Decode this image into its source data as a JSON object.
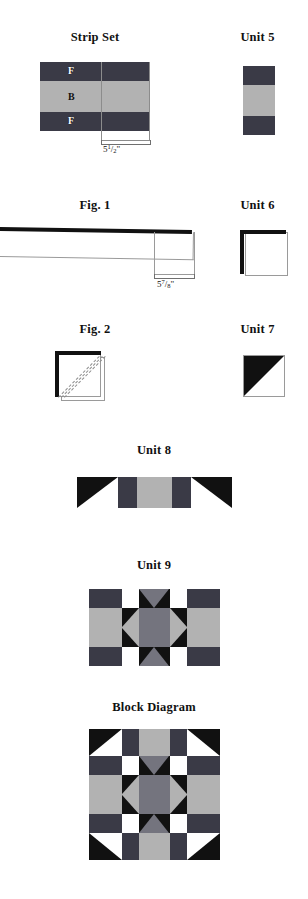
{
  "document": {
    "type": "quilt-block-instruction-diagrams"
  },
  "palette": {
    "dark": "#3a3a46",
    "black": "#111111",
    "medium_gray": "#74747e",
    "light_gray": "#b2b2b2",
    "white": "#ffffff",
    "outline": "#9a9a9a",
    "guide": "#8c8c8c"
  },
  "figures": [
    {
      "id": "strip-set",
      "label": "Strip Set",
      "measurement": {
        "whole": "5",
        "numerator": "1",
        "denominator": "2",
        "unit": "\""
      },
      "bands": [
        {
          "letter": "F",
          "fabric": "dark"
        },
        {
          "letter": "B",
          "fabric": "light_gray"
        },
        {
          "letter": "F",
          "fabric": "dark"
        }
      ]
    },
    {
      "id": "unit-5",
      "label": "Unit 5",
      "bands": [
        {
          "fabric": "dark"
        },
        {
          "fabric": "light_gray"
        },
        {
          "fabric": "dark"
        }
      ]
    },
    {
      "id": "fig-1",
      "label": "Fig. 1",
      "measurement": {
        "whole": "5",
        "numerator": "7",
        "denominator": "8",
        "unit": "\""
      }
    },
    {
      "id": "unit-6",
      "label": "Unit 6"
    },
    {
      "id": "fig-2",
      "label": "Fig. 2"
    },
    {
      "id": "unit-7",
      "label": "Unit 7"
    },
    {
      "id": "unit-8",
      "label": "Unit 8"
    },
    {
      "id": "unit-9",
      "label": "Unit 9"
    },
    {
      "id": "block-diagram",
      "label": "Block Diagram"
    }
  ]
}
